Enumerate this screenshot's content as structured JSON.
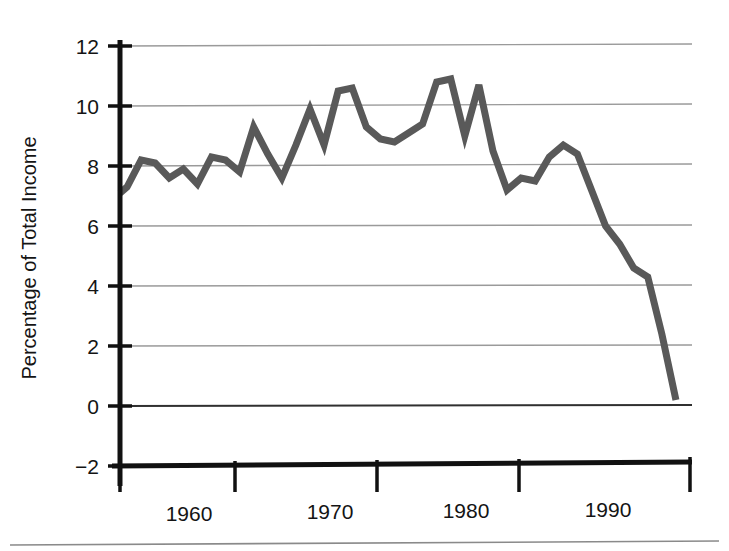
{
  "chart_data": {
    "type": "line",
    "title": "",
    "subtitle": "",
    "xlabel": "",
    "ylabel": "Percentage of Total Income",
    "xlim": [
      1955.5,
      1996
    ],
    "ylim": [
      -2,
      12
    ],
    "grid": true,
    "legend": false,
    "legend_position": "none",
    "y_ticks": [
      -2,
      0,
      2,
      4,
      6,
      8,
      10,
      12
    ],
    "y_tick_labels": [
      "−2",
      "0",
      "2",
      "4",
      "6",
      "8",
      "10",
      "12"
    ],
    "x_ticks": [
      1957,
      1965,
      1975,
      1985,
      1995
    ],
    "x_tick_labels": [
      "",
      "",
      "",
      "",
      ""
    ],
    "x_label_positions": [
      1960,
      1970,
      1980,
      1990
    ],
    "x_labels": [
      "1960",
      "1970",
      "1980",
      "1990"
    ],
    "line_color": "#595959",
    "line_width": 7,
    "series": [
      {
        "name": "Percentage of Total Income",
        "x": [
          1955.5,
          1956,
          1957,
          1958,
          1959,
          1960,
          1961,
          1962,
          1963,
          1964,
          1965,
          1966,
          1967,
          1968,
          1969,
          1970,
          1971,
          1972,
          1973,
          1974,
          1975,
          1976,
          1977,
          1978,
          1979,
          1980,
          1981,
          1982,
          1983,
          1984,
          1985,
          1986,
          1987,
          1988,
          1989,
          1990,
          1991,
          1992,
          1993,
          1994,
          1995
        ],
        "values": [
          7.1,
          7.3,
          8.2,
          8.1,
          7.6,
          7.9,
          7.4,
          8.3,
          8.2,
          7.8,
          9.3,
          8.4,
          7.6,
          8.7,
          9.9,
          8.7,
          10.5,
          10.6,
          9.3,
          8.9,
          8.8,
          9.1,
          9.4,
          10.8,
          10.9,
          9.0,
          10.7,
          8.5,
          7.2,
          7.6,
          7.5,
          8.3,
          8.7,
          8.4,
          7.2,
          6.0,
          5.4,
          4.6,
          4.3,
          2.4,
          0.2
        ]
      }
    ]
  },
  "axes": {
    "y_axis_label": "Percentage of Total Income",
    "y_tick_0": "−2",
    "y_tick_1": "0",
    "y_tick_2": "2",
    "y_tick_3": "4",
    "y_tick_4": "6",
    "y_tick_5": "8",
    "y_tick_6": "10",
    "y_tick_7": "12",
    "x_label_0": "1960",
    "x_label_1": "1970",
    "x_label_2": "1980",
    "x_label_3": "1990"
  },
  "colors": {
    "line": "#595959",
    "grid": "#9a9a9a",
    "axis": "#111111",
    "background": "#ffffff"
  }
}
